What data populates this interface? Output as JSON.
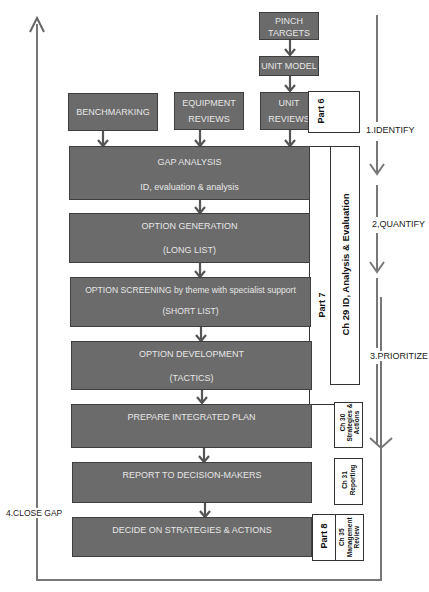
{
  "top_inputs": {
    "pinch_targets": [
      "PINCH",
      "TARGETS"
    ],
    "unit_model": "UNIT MODEL",
    "benchmarking": "BENCHMARKING",
    "equipment_reviews": [
      "EQUIPMENT",
      "REVIEWS"
    ],
    "unit_reviews": [
      "UNIT",
      "REVIEWS"
    ]
  },
  "steps": [
    {
      "title": "GAP ANALYSIS",
      "subtitle": "ID, evaluation & analysis"
    },
    {
      "title": "OPTION GENERATION",
      "subtitle": "(LONG LIST)"
    },
    {
      "title": "OPTION SCREENING by theme with specialist support",
      "subtitle": "(SHORT LIST)"
    },
    {
      "title": "OPTION DEVELOPMENT",
      "subtitle": "(TACTICS)"
    },
    {
      "title": "PREPARE INTEGRATED PLAN",
      "subtitle": ""
    },
    {
      "title": "REPORT TO DECISION-MAKERS",
      "subtitle": ""
    },
    {
      "title": "DECIDE ON STRATEGIES & ACTIONS",
      "subtitle": ""
    }
  ],
  "parts": {
    "part6": "Part 6",
    "part7": "Part 7",
    "part8": "Part 8"
  },
  "chapters": {
    "ch29": "Ch 29 ID, Analysis & Evaluation",
    "ch30": [
      "Ch 30",
      "Strategies &",
      "Actions"
    ],
    "ch31": [
      "Ch 31",
      "Reporting"
    ],
    "ch35": [
      "Ch 35",
      "Management",
      "Review"
    ]
  },
  "phases": {
    "identify": "1.IDENTIFY",
    "quantify": "2,QUANTIFY",
    "prioritize": "3.PRIORITIZE",
    "close_gap": "4.CLOSE GAP"
  }
}
